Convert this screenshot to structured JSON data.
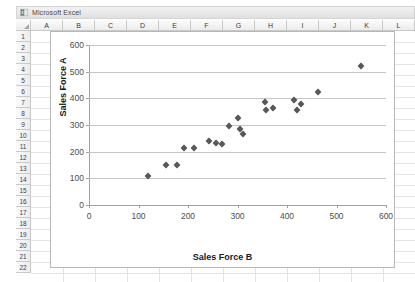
{
  "window": {
    "title": "Microsoft Excel",
    "icon": "excel-icon"
  },
  "sheet": {
    "columns": [
      "A",
      "B",
      "C",
      "D",
      "E",
      "F",
      "G",
      "H",
      "I",
      "J",
      "K",
      "L"
    ],
    "rows": [
      "1",
      "2",
      "3",
      "4",
      "5",
      "6",
      "7",
      "8",
      "9",
      "10",
      "11",
      "12",
      "13",
      "14",
      "15",
      "16",
      "17",
      "18",
      "19",
      "20",
      "21",
      "22"
    ]
  },
  "chart_data": {
    "type": "scatter",
    "title": "",
    "xlabel": "Sales Force B",
    "ylabel": "Sales Force A",
    "xlim": [
      0,
      600
    ],
    "ylim": [
      0,
      600
    ],
    "xticks": [
      0,
      100,
      200,
      300,
      400,
      500,
      600
    ],
    "yticks": [
      0,
      100,
      200,
      300,
      400,
      500,
      600
    ],
    "grid": true,
    "legend": false,
    "marker": "diamond",
    "marker_color": "#585858",
    "series": [
      {
        "name": "Sales Force A vs B",
        "points": [
          [
            120,
            110
          ],
          [
            155,
            150
          ],
          [
            178,
            150
          ],
          [
            192,
            215
          ],
          [
            212,
            215
          ],
          [
            243,
            240
          ],
          [
            256,
            232
          ],
          [
            268,
            230
          ],
          [
            283,
            295
          ],
          [
            300,
            325
          ],
          [
            305,
            285
          ],
          [
            312,
            265
          ],
          [
            355,
            385
          ],
          [
            358,
            355
          ],
          [
            372,
            365
          ],
          [
            415,
            395
          ],
          [
            420,
            355
          ],
          [
            428,
            380
          ],
          [
            462,
            425
          ],
          [
            550,
            520
          ]
        ]
      }
    ]
  }
}
